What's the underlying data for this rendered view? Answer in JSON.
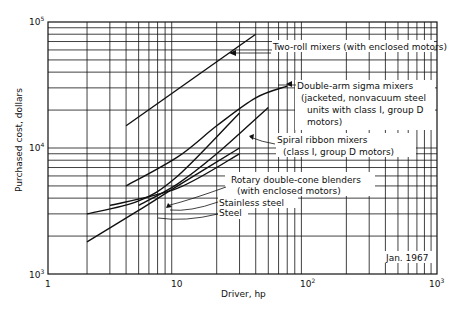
{
  "chart_data": {
    "type": "line",
    "title": "",
    "xlabel": "Driver, hp",
    "ylabel": "Purchased cost, dollars",
    "xscale": "log",
    "yscale": "log",
    "xlim": [
      1,
      1000
    ],
    "ylim": [
      1000,
      100000
    ],
    "grid": true,
    "x_tick_labels": [
      "1",
      "10",
      "10²",
      "10³"
    ],
    "y_tick_labels": [
      "10³",
      "10⁴",
      "10⁵"
    ],
    "annotation": "Jan. 1967",
    "series": [
      {
        "name": "Two-roll mixers (with enclosed motors)",
        "x": [
          4,
          40
        ],
        "values": [
          15000,
          80000
        ]
      },
      {
        "name": "Double-arm sigma mixers (jacketed, nonvacuum steel units with class I, group D motors)",
        "x": [
          4,
          10,
          20,
          40,
          70
        ],
        "values": [
          5000,
          8500,
          15000,
          25000,
          31000
        ]
      },
      {
        "name": "Spiral ribbon mixers (class I, group D motors)",
        "x": [
          5,
          10,
          20,
          50
        ],
        "values": [
          3500,
          5200,
          9000,
          21000
        ]
      },
      {
        "name": "Rotary double-cone blenders (with enclosed motors)",
        "x": [
          3,
          10,
          30
        ],
        "values": [
          3500,
          4800,
          9000
        ]
      },
      {
        "name": "Stainless steel",
        "x": [
          2,
          5,
          10,
          30
        ],
        "values": [
          3000,
          3800,
          6000,
          19000
        ]
      },
      {
        "name": "Steel",
        "x": [
          2,
          5,
          10,
          30
        ],
        "values": [
          1800,
          3200,
          5000,
          10000
        ]
      }
    ]
  },
  "labels": {
    "two_roll": "Two-roll mixers (with enclosed motors)",
    "double_arm_1": "Double-arm sigma mixers",
    "double_arm_2": "(jacketed, nonvacuum steel",
    "double_arm_3": "units with class I, group D",
    "double_arm_4": "motors)",
    "spiral_1": "Spiral ribbon mixers",
    "spiral_2": "(class I, group D motors)",
    "rotary_1": "Rotary double-cone blenders",
    "rotary_2": "(with enclosed motors)",
    "stainless": "Stainless steel",
    "steel": "Steel",
    "date": "Jan. 1967"
  },
  "axes": {
    "xlabel": "Driver, hp",
    "ylabel": "Purchased cost, dollars",
    "x1": "1",
    "x10": "10",
    "x100": "10",
    "x100_exp": "2",
    "x1000": "10",
    "x1000_exp": "3",
    "y1000": "10",
    "y1000_exp": "3",
    "y10000": "10",
    "y10000_exp": "4",
    "y100000": "10",
    "y100000_exp": "5"
  }
}
